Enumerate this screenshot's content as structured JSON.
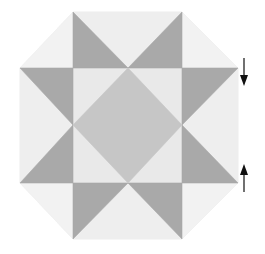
{
  "diagram": {
    "type": "quilt-block",
    "name": "Ohio Star variant (octagon)",
    "colors": {
      "background": "#ffffff",
      "light": "#eeeeee",
      "corner_light": "#f2f2f2",
      "inner_light": "#e9e9e9",
      "dark": "#a9a9a9",
      "center": "#c6c6c6",
      "arrow": "#111111"
    },
    "grid": {
      "x": [
        20,
        73,
        128,
        182,
        238
      ],
      "y": [
        12,
        68,
        125,
        183,
        239
      ]
    },
    "arrows": [
      {
        "direction": "down",
        "x": 244,
        "y1": 58,
        "y2": 86
      },
      {
        "direction": "up",
        "x": 244,
        "y1": 164,
        "y2": 192
      }
    ]
  }
}
